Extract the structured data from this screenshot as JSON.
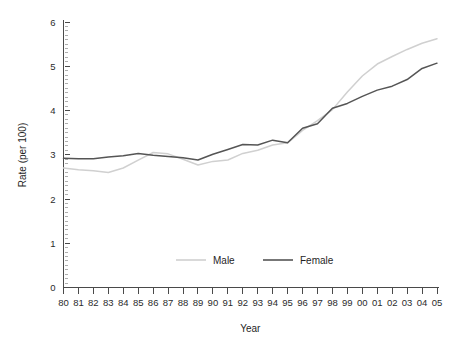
{
  "chart_data": {
    "type": "line",
    "title": "",
    "xlabel": "Year",
    "ylabel": "Rate (per 100)",
    "x": [
      "80",
      "81",
      "82",
      "83",
      "84",
      "85",
      "86",
      "87",
      "88",
      "89",
      "90",
      "91",
      "92",
      "93",
      "94",
      "95",
      "96",
      "97",
      "98",
      "99",
      "00",
      "01",
      "02",
      "03",
      "04",
      "05"
    ],
    "xtick_labels": [
      "80",
      "81",
      "82",
      "83",
      "84",
      "85",
      "86",
      "87",
      "88",
      "89",
      "90",
      "91",
      "92",
      "93",
      "94",
      "95",
      "96",
      "97",
      "98",
      "99",
      "00",
      "01",
      "02",
      "03",
      "04",
      "05"
    ],
    "ytick_labels": [
      "0",
      "1",
      "2",
      "3",
      "4",
      "5",
      "6"
    ],
    "ytick_values": [
      0,
      1,
      2,
      3,
      4,
      5,
      6
    ],
    "ylim": [
      0,
      6.2
    ],
    "y_minor_tick_step": 0.1,
    "grid": false,
    "legend_position": "inside-bottom-center",
    "series": [
      {
        "name": "Male",
        "color": "#d0d0d0",
        "values": [
          2.7,
          2.66,
          2.64,
          2.6,
          2.7,
          2.88,
          3.05,
          3.02,
          2.9,
          2.77,
          2.85,
          2.88,
          3.03,
          3.1,
          3.22,
          3.27,
          3.55,
          3.77,
          4.02,
          4.42,
          4.78,
          5.05,
          5.22,
          5.38,
          5.52,
          5.62
        ]
      },
      {
        "name": "Female",
        "color": "#555555",
        "values": [
          2.92,
          2.91,
          2.91,
          2.95,
          2.98,
          3.03,
          2.99,
          2.96,
          2.93,
          2.88,
          3.01,
          3.12,
          3.23,
          3.22,
          3.33,
          3.27,
          3.6,
          3.7,
          4.05,
          4.16,
          4.32,
          4.46,
          4.55,
          4.7,
          4.95,
          5.07
        ]
      }
    ],
    "legend": [
      {
        "label": "Male",
        "color": "#d0d0d0"
      },
      {
        "label": "Female",
        "color": "#555555"
      }
    ]
  },
  "axes": {
    "y_axis_title": "Rate (per 100)",
    "x_axis_title": "Year"
  }
}
